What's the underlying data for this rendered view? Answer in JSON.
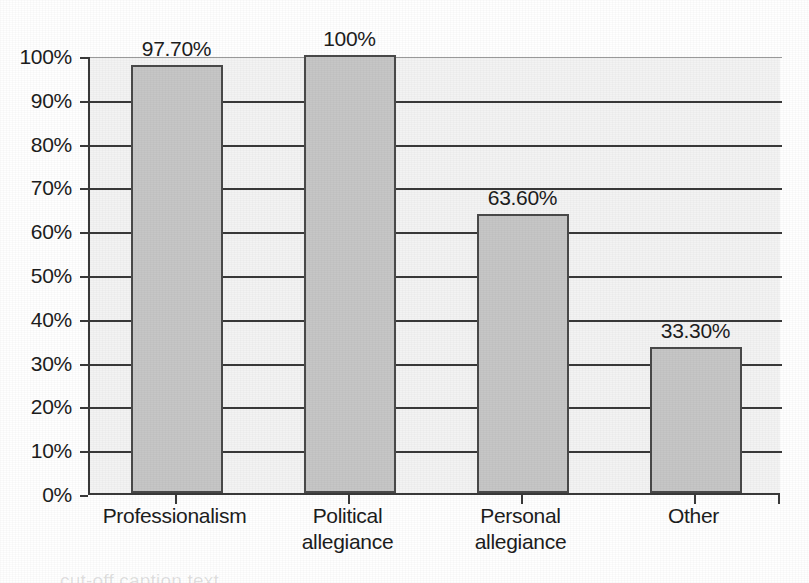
{
  "chart_data": {
    "type": "bar",
    "title": "",
    "subtitle": "",
    "xlabel": "",
    "ylabel": "",
    "categories": [
      "Professionalism",
      "Political allegiance",
      "Personal allegiance",
      "Other"
    ],
    "category_lines": [
      [
        "Professionalism"
      ],
      [
        "Political",
        "allegiance"
      ],
      [
        "Personal",
        "allegiance"
      ],
      [
        "Other"
      ]
    ],
    "values": [
      97.7,
      100,
      63.6,
      33.3
    ],
    "data_labels": [
      "97.70%",
      "100%",
      "63.60%",
      "33.30%"
    ],
    "ylim": [
      0,
      100
    ],
    "ytick_values": [
      0,
      10,
      20,
      30,
      40,
      50,
      60,
      70,
      80,
      90,
      100
    ],
    "ytick_labels": [
      "0%",
      "10%",
      "20%",
      "30%",
      "40%",
      "50%",
      "60%",
      "70%",
      "80%",
      "90%",
      "100%"
    ],
    "grid": true,
    "grid_axis": "y",
    "legend": false,
    "legend_position": "none",
    "bar_fill_color": "#c6c6c6",
    "bar_border_color": "#4a4a4a",
    "plot_background_color": "#f3f3f3",
    "axis_color": "#3a3a3a",
    "text_color": "#1d1d1d"
  },
  "caption": {
    "ghost_text": "cut-off caption text"
  }
}
